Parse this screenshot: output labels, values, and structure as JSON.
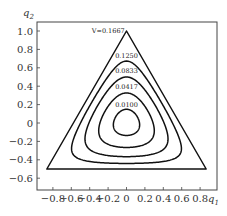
{
  "chart_data": {
    "type": "contour",
    "title": "",
    "xlabel": "q",
    "xlabel_sub": "1",
    "ylabel": "q",
    "ylabel_sub": "2",
    "xlim": [
      -0.95,
      0.98
    ],
    "ylim": [
      -0.73,
      1.09
    ],
    "xticks": [
      -0.8,
      -0.6,
      -0.4,
      -0.2,
      0,
      0.2,
      0.4,
      0.6,
      0.8
    ],
    "xtick_labels": [
      "−0.8",
      "−0.6",
      "−0.4",
      "−0.2",
      "0",
      "0.2",
      "0.4",
      "0.6",
      "0.8"
    ],
    "yticks": [
      1.0,
      0.8,
      0.6,
      0.4,
      0.2,
      0,
      -0.2,
      -0.4,
      -0.6
    ],
    "ytick_labels": [
      "1.0",
      "0.8",
      "0.6",
      "0.4",
      "0.2",
      "0",
      "−0.2",
      "−0.4",
      "−0.6"
    ],
    "grid": false,
    "levels": [
      {
        "value": 0.1667,
        "label": "V=0.1667",
        "shape": "triangle",
        "vertices": [
          [
            0,
            1.0
          ],
          [
            -0.866,
            -0.5
          ],
          [
            0.866,
            -0.5
          ]
        ],
        "label_pos": [
          -0.02,
          1.0
        ],
        "label_anchor": "end"
      },
      {
        "value": 0.125,
        "label": "0.1250",
        "label_pos": [
          0,
          0.73
        ],
        "label_anchor": "middle"
      },
      {
        "value": 0.0833,
        "label": "0.0833",
        "label_pos": [
          0,
          0.56
        ],
        "label_anchor": "middle"
      },
      {
        "value": 0.0417,
        "label": "0.0417",
        "label_pos": [
          0,
          0.39
        ],
        "label_anchor": "middle"
      },
      {
        "value": 0.01,
        "label": "0.0100",
        "label_pos": [
          0,
          0.2
        ],
        "label_anchor": "middle"
      }
    ],
    "contour_tops": {
      "0.1250": 0.67,
      "0.0833": 0.5,
      "0.0417": 0.33,
      "0.0100": 0.16
    },
    "colors": {
      "contour": "#111111",
      "frame": "#444444",
      "text": "#333333"
    }
  }
}
